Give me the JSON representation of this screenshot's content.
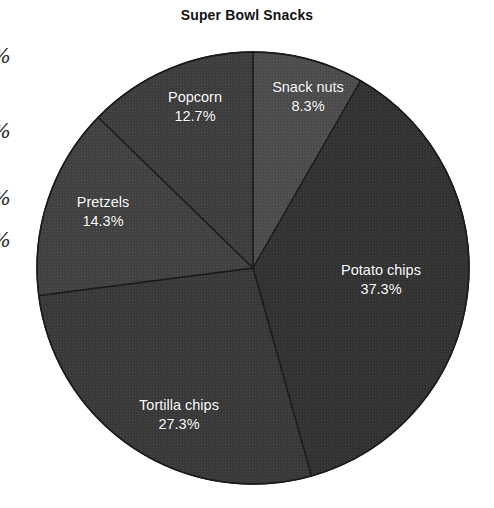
{
  "chart_data": {
    "type": "pie",
    "title": "Super Bowl Snacks",
    "xlabel": "",
    "ylabel": "",
    "legend_position": "none",
    "grid": false,
    "value_unit": "percent",
    "start_angle_deg": 90,
    "direction": "clockwise",
    "categories": [
      "Snack nuts",
      "Potato chips",
      "Tortilla chips",
      "Pretzels",
      "Popcorn"
    ],
    "values": [
      8.3,
      37.3,
      27.3,
      14.3,
      12.7
    ],
    "slices": [
      {
        "name": "Snack nuts",
        "value": 8.3,
        "value_label": "8.3%",
        "color": "#4d4d4d",
        "label_line1": "Snack nuts",
        "label_line2": "8.3%"
      },
      {
        "name": "Potato chips",
        "value": 37.3,
        "value_label": "37.3%",
        "color": "#333333",
        "label_line1": "Potato chips",
        "label_line2": "37.3%"
      },
      {
        "name": "Tortilla chips",
        "value": 27.3,
        "value_label": "27.3%",
        "color": "#3a3a3a",
        "label_line1": "Tortilla chips",
        "label_line2": "27.3%"
      },
      {
        "name": "Pretzels",
        "value": 14.3,
        "value_label": "14.3%",
        "color": "#424242",
        "label_line1": "Pretzels",
        "label_line2": "14.3%"
      },
      {
        "name": "Popcorn",
        "value": 12.7,
        "value_label": "12.7%",
        "color": "#3e3e3e",
        "label_line1": "Popcorn",
        "label_line2": "12.7%"
      }
    ],
    "label_text_color": "#ffffff",
    "separator_color": "#1a1a1a",
    "background": "#ffffff"
  },
  "margin_glyphs": {
    "items": [
      {
        "text": "%"
      },
      {
        "text": "%"
      },
      {
        "text": "%"
      },
      {
        "text": "%"
      }
    ]
  }
}
